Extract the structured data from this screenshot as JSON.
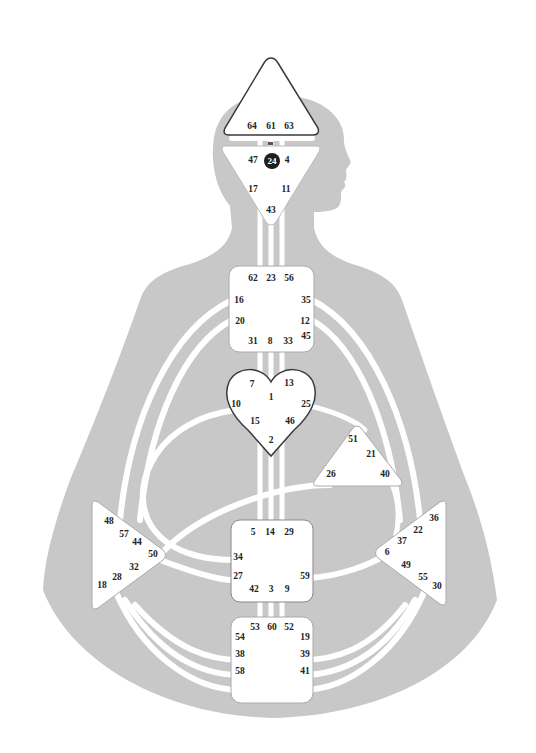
{
  "colors": {
    "background": "#ffffff",
    "body": "#c8c8c8",
    "channel": "#ffffff",
    "center_fill": "#ffffff",
    "center_stroke": "#9a9a9a",
    "heart_stroke": "#3a3a3a",
    "head_stroke": "#3a3a3a",
    "text": "#222222",
    "active_gate_fill": "#1e1e1e"
  },
  "centers": {
    "head": {
      "label": "Head",
      "gates": [
        "64",
        "61",
        "63"
      ]
    },
    "ajna": {
      "label": "Ajna",
      "gates": [
        "47",
        "24",
        "4",
        "17",
        "11",
        "43"
      ],
      "active_gates": [
        "24"
      ]
    },
    "throat": {
      "label": "Throat",
      "gates": [
        "62",
        "23",
        "56",
        "16",
        "35",
        "20",
        "12",
        "45",
        "31",
        "8",
        "33"
      ]
    },
    "g": {
      "label": "G",
      "gates": [
        "7",
        "1",
        "13",
        "10",
        "25",
        "15",
        "46",
        "2"
      ]
    },
    "ego": {
      "label": "Ego",
      "gates": [
        "51",
        "21",
        "26",
        "40"
      ]
    },
    "spleen": {
      "label": "Spleen",
      "gates": [
        "48",
        "57",
        "44",
        "50",
        "32",
        "28",
        "18"
      ]
    },
    "sacral": {
      "label": "Sacral",
      "gates": [
        "5",
        "14",
        "29",
        "34",
        "27",
        "59",
        "42",
        "3",
        "9"
      ]
    },
    "solar_plexus": {
      "label": "Solar Plexus",
      "gates": [
        "36",
        "22",
        "37",
        "6",
        "49",
        "55",
        "30"
      ]
    },
    "root": {
      "label": "Root",
      "gates": [
        "53",
        "60",
        "52",
        "54",
        "19",
        "38",
        "39",
        "58",
        "41"
      ]
    }
  },
  "gate_positions": [
    {
      "id": "64",
      "x": 252,
      "y": 127
    },
    {
      "id": "61",
      "x": 271,
      "y": 127
    },
    {
      "id": "63",
      "x": 289,
      "y": 127
    },
    {
      "id": "47",
      "x": 253,
      "y": 161
    },
    {
      "id": "24",
      "x": 272,
      "y": 161
    },
    {
      "id": "4",
      "x": 287,
      "y": 161
    },
    {
      "id": "17",
      "x": 253,
      "y": 190
    },
    {
      "id": "11",
      "x": 286,
      "y": 190
    },
    {
      "id": "43",
      "x": 271,
      "y": 211
    },
    {
      "id": "62",
      "x": 253,
      "y": 279
    },
    {
      "id": "23",
      "x": 271,
      "y": 279
    },
    {
      "id": "56",
      "x": 289,
      "y": 279
    },
    {
      "id": "16",
      "x": 239,
      "y": 301
    },
    {
      "id": "35",
      "x": 306,
      "y": 301
    },
    {
      "id": "20",
      "x": 240,
      "y": 322
    },
    {
      "id": "12",
      "x": 305,
      "y": 322
    },
    {
      "id": "45",
      "x": 306,
      "y": 337
    },
    {
      "id": "31",
      "x": 253,
      "y": 342
    },
    {
      "id": "8",
      "x": 270,
      "y": 342
    },
    {
      "id": "33",
      "x": 288,
      "y": 342
    },
    {
      "id": "7",
      "x": 252,
      "y": 385
    },
    {
      "id": "13",
      "x": 289,
      "y": 384
    },
    {
      "id": "1",
      "x": 271,
      "y": 398
    },
    {
      "id": "10",
      "x": 236,
      "y": 405
    },
    {
      "id": "25",
      "x": 306,
      "y": 405
    },
    {
      "id": "15",
      "x": 255,
      "y": 422
    },
    {
      "id": "46",
      "x": 290,
      "y": 422
    },
    {
      "id": "2",
      "x": 271,
      "y": 441
    },
    {
      "id": "51",
      "x": 353,
      "y": 440
    },
    {
      "id": "21",
      "x": 371,
      "y": 455
    },
    {
      "id": "26",
      "x": 331,
      "y": 475
    },
    {
      "id": "40",
      "x": 385,
      "y": 475
    },
    {
      "id": "48",
      "x": 109,
      "y": 522
    },
    {
      "id": "57",
      "x": 124,
      "y": 535
    },
    {
      "id": "44",
      "x": 137,
      "y": 543
    },
    {
      "id": "50",
      "x": 153,
      "y": 555
    },
    {
      "id": "32",
      "x": 134,
      "y": 568
    },
    {
      "id": "28",
      "x": 117,
      "y": 578
    },
    {
      "id": "18",
      "x": 102,
      "y": 586
    },
    {
      "id": "5",
      "x": 253,
      "y": 533
    },
    {
      "id": "14",
      "x": 270,
      "y": 533
    },
    {
      "id": "29",
      "x": 289,
      "y": 533
    },
    {
      "id": "34",
      "x": 238,
      "y": 558
    },
    {
      "id": "27",
      "x": 238,
      "y": 577
    },
    {
      "id": "59",
      "x": 305,
      "y": 577
    },
    {
      "id": "42",
      "x": 254,
      "y": 590
    },
    {
      "id": "3",
      "x": 271,
      "y": 590
    },
    {
      "id": "9",
      "x": 287,
      "y": 590
    },
    {
      "id": "36",
      "x": 434,
      "y": 519
    },
    {
      "id": "22",
      "x": 418,
      "y": 531
    },
    {
      "id": "37",
      "x": 402,
      "y": 542
    },
    {
      "id": "6",
      "x": 387,
      "y": 553
    },
    {
      "id": "49",
      "x": 406,
      "y": 566
    },
    {
      "id": "55",
      "x": 423,
      "y": 578
    },
    {
      "id": "30",
      "x": 437,
      "y": 587
    },
    {
      "id": "53",
      "x": 255,
      "y": 628
    },
    {
      "id": "60",
      "x": 272,
      "y": 628
    },
    {
      "id": "52",
      "x": 289,
      "y": 628
    },
    {
      "id": "54",
      "x": 240,
      "y": 638
    },
    {
      "id": "19",
      "x": 305,
      "y": 638
    },
    {
      "id": "38",
      "x": 240,
      "y": 655
    },
    {
      "id": "39",
      "x": 305,
      "y": 655
    },
    {
      "id": "58",
      "x": 240,
      "y": 672
    },
    {
      "id": "41",
      "x": 305,
      "y": 672
    }
  ]
}
